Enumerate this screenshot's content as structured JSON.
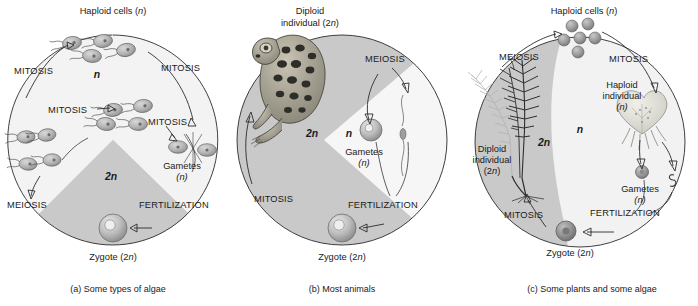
{
  "figure": {
    "type": "diagram"
  },
  "shared_terms": {
    "mitosis": "MITOSIS",
    "meiosis": "MEIOSIS",
    "fertilization": "FERTILIZATION",
    "haploid_symbol": "n",
    "diploid_symbol": "2n"
  },
  "colors": {
    "diploid_region": "#c9c9c9",
    "haploid_region": "#f6f6f6",
    "ring_background": "#f3f3f3",
    "line": "#2b2b2b",
    "text": "#1a1a1a"
  },
  "panels": [
    {
      "id": "a",
      "caption": "(a) Some types of algae",
      "caption_letter": "(a)",
      "caption_text": "Some types of algae",
      "regions": {
        "haploid_label": "n",
        "diploid_label": "2n"
      },
      "labels": {
        "haploid_cells": "Haploid cells (",
        "haploid_cells_full": "Haploid cells (n)",
        "gametes": "Gametes",
        "gametes_sub": "(n)",
        "zygote": "Zygote (2n)",
        "mitosis_1": "MITOSIS",
        "mitosis_2": "MITOSIS",
        "mitosis_3": "MITOSIS",
        "mitosis_4": "MITOSIS",
        "meiosis": "MEIOSIS",
        "fertilization": "FERTILIZATION"
      },
      "organism": "flagellated-algal-cell",
      "cell_counts": {
        "top_cluster": 4,
        "middle_cluster": 4,
        "left_cluster": 4,
        "fusing_gametes": 2
      }
    },
    {
      "id": "b",
      "caption": "(b) Most animals",
      "caption_letter": "(b)",
      "caption_text": "Most animals",
      "regions": {
        "haploid_label": "n",
        "diploid_label": "2n"
      },
      "labels": {
        "diploid_individual": "Diploid",
        "diploid_individual_2": "individual (2n)",
        "gametes": "Gametes",
        "gametes_sub": "(n)",
        "zygote": "Zygote (2n)",
        "mitosis": "MITOSIS",
        "meiosis": "MEIOSIS",
        "fertilization": "FERTILIZATION"
      },
      "organism": "frog"
    },
    {
      "id": "c",
      "caption": "(c) Some plants and some algae",
      "caption_letter": "(c)",
      "caption_text": "Some plants and some algae",
      "regions": {
        "haploid_label": "n",
        "diploid_label": "2n"
      },
      "labels": {
        "haploid_cells": "Haploid cells (n)",
        "haploid_individual": "Haploid",
        "haploid_individual_2": "individual",
        "haploid_individual_3": "(n)",
        "diploid_individual": "Diploid",
        "diploid_individual_2": "individual",
        "diploid_individual_3": "(2n)",
        "gametes": "Gametes",
        "gametes_sub": "(n)",
        "zygote": "Zygote (2n)",
        "mitosis_1": "MITOSIS",
        "mitosis_2": "MITOSIS",
        "meiosis": "MEIOSIS",
        "fertilization": "FERTILIZATION"
      },
      "organism_diploid": "fern-sporophyte",
      "organism_haploid": "heart-shaped-gametophyte",
      "cell_counts": {
        "haploid_spores": 6
      }
    }
  ]
}
